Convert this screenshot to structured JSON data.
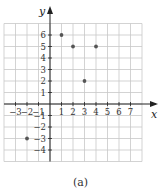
{
  "chart_data": {
    "type": "scatter",
    "title": "",
    "caption": "(a)",
    "xlabel": "x",
    "ylabel": "y",
    "xlim": [
      -4,
      8
    ],
    "ylim": [
      -5,
      7
    ],
    "grid": true,
    "x_ticks": [
      -3,
      -2,
      -1,
      1,
      2,
      3,
      4,
      5,
      6,
      7
    ],
    "y_ticks": [
      6,
      5,
      4,
      3,
      2,
      1,
      -1,
      -2,
      -3,
      -4
    ],
    "points": [
      {
        "x": 1,
        "y": 6
      },
      {
        "x": 2,
        "y": 5
      },
      {
        "x": 4,
        "y": 5
      },
      {
        "x": 3,
        "y": 2
      },
      {
        "x": -2,
        "y": -3
      }
    ],
    "colors": {
      "grid": "#c8c8c8",
      "axis": "#222222",
      "point": "#555555"
    }
  }
}
